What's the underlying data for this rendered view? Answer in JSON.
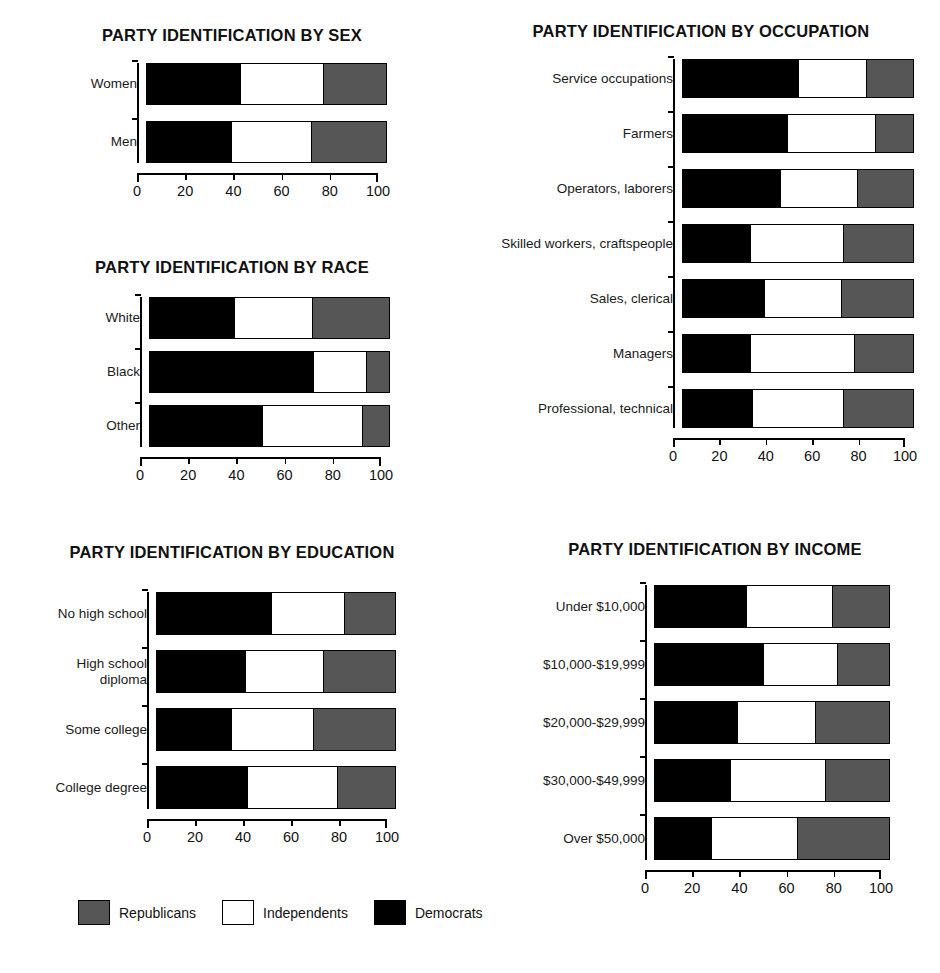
{
  "legend": {
    "items": [
      {
        "key": "rep",
        "label": "Republicans",
        "color": "#565656"
      },
      {
        "key": "ind",
        "label": "Independents",
        "color": "#ffffff"
      },
      {
        "key": "dem",
        "label": "Democrats",
        "color": "#000000"
      }
    ]
  },
  "axis": {
    "ticks": [
      0,
      20,
      40,
      60,
      80,
      100
    ],
    "tick_labels": [
      "0",
      "20",
      "40",
      "60",
      "80",
      "100"
    ],
    "min": 0,
    "max": 100
  },
  "panels": {
    "sex": {
      "title": "PARTY IDENTIFICATION BY SEX"
    },
    "race": {
      "title": "PARTY IDENTIFICATION BY RACE"
    },
    "occupation": {
      "title": "PARTY IDENTIFICATION BY OCCUPATION"
    },
    "education": {
      "title": "PARTY IDENTIFICATION BY EDUCATION"
    },
    "income": {
      "title": "PARTY IDENTIFICATION BY INCOME"
    }
  },
  "chart_data": [
    {
      "id": "sex",
      "type": "bar",
      "orientation": "horizontal",
      "stacked": true,
      "title": "PARTY IDENTIFICATION BY SEX",
      "xlabel": "",
      "ylabel": "",
      "xlim": [
        0,
        100
      ],
      "xticks": [
        0,
        20,
        40,
        60,
        80,
        100
      ],
      "grid": false,
      "legend_position": "bottom",
      "categories": [
        "Women",
        "Men"
      ],
      "series": [
        {
          "name": "Democrats",
          "color": "#000000",
          "values": [
            39,
            35
          ]
        },
        {
          "name": "Independents",
          "color": "#ffffff",
          "values": [
            35,
            34
          ]
        },
        {
          "name": "Republicans",
          "color": "#565656",
          "values": [
            26,
            31
          ]
        }
      ]
    },
    {
      "id": "race",
      "type": "bar",
      "orientation": "horizontal",
      "stacked": true,
      "title": "PARTY IDENTIFICATION BY RACE",
      "xlabel": "",
      "ylabel": "",
      "xlim": [
        0,
        100
      ],
      "xticks": [
        0,
        20,
        40,
        60,
        80,
        100
      ],
      "grid": false,
      "legend_position": "bottom",
      "categories": [
        "White",
        "Black",
        "Other"
      ],
      "series": [
        {
          "name": "Democrats",
          "color": "#000000",
          "values": [
            35,
            68,
            47
          ]
        },
        {
          "name": "Independents",
          "color": "#ffffff",
          "values": [
            33,
            23,
            42
          ]
        },
        {
          "name": "Republicans",
          "color": "#565656",
          "values": [
            32,
            9,
            11
          ]
        }
      ]
    },
    {
      "id": "occupation",
      "type": "bar",
      "orientation": "horizontal",
      "stacked": true,
      "title": "PARTY IDENTIFICATION BY OCCUPATION",
      "xlabel": "",
      "ylabel": "",
      "xlim": [
        0,
        100
      ],
      "xticks": [
        0,
        20,
        40,
        60,
        80,
        100
      ],
      "grid": false,
      "legend_position": "bottom",
      "categories": [
        "Service occupations",
        "Farmers",
        "Operators, laborers",
        "Skilled workers, craftspeople",
        "Sales, clerical",
        "Managers",
        "Professional, technical"
      ],
      "series": [
        {
          "name": "Democrats",
          "color": "#000000",
          "values": [
            50,
            45,
            42,
            29,
            35,
            29,
            30
          ]
        },
        {
          "name": "Independents",
          "color": "#ffffff",
          "values": [
            30,
            39,
            34,
            41,
            34,
            46,
            40
          ]
        },
        {
          "name": "Republicans",
          "color": "#565656",
          "values": [
            20,
            16,
            24,
            30,
            31,
            25,
            30
          ]
        }
      ]
    },
    {
      "id": "education",
      "type": "bar",
      "orientation": "horizontal",
      "stacked": true,
      "title": "PARTY IDENTIFICATION BY EDUCATION",
      "xlabel": "",
      "ylabel": "",
      "xlim": [
        0,
        100
      ],
      "xticks": [
        0,
        20,
        40,
        60,
        80,
        100
      ],
      "grid": false,
      "legend_position": "bottom",
      "categories": [
        "No high school",
        "High school\ndiploma",
        "Some college",
        "College degree"
      ],
      "series": [
        {
          "name": "Democrats",
          "color": "#000000",
          "values": [
            48,
            37,
            31,
            38
          ]
        },
        {
          "name": "Independents",
          "color": "#ffffff",
          "values": [
            31,
            33,
            35,
            38
          ]
        },
        {
          "name": "Republicans",
          "color": "#565656",
          "values": [
            21,
            30,
            34,
            24
          ]
        }
      ]
    },
    {
      "id": "income",
      "type": "bar",
      "orientation": "horizontal",
      "stacked": true,
      "title": "PARTY IDENTIFICATION BY INCOME",
      "xlabel": "",
      "ylabel": "",
      "xlim": [
        0,
        100
      ],
      "xticks": [
        0,
        20,
        40,
        60,
        80,
        100
      ],
      "grid": false,
      "legend_position": "bottom",
      "categories": [
        "Under $10,000",
        "$10,000-$19,999",
        "$20,000-$29,999",
        "$30,000-$49,999",
        "Over $50,000"
      ],
      "series": [
        {
          "name": "Democrats",
          "color": "#000000",
          "values": [
            39,
            46,
            35,
            32,
            24
          ]
        },
        {
          "name": "Independents",
          "color": "#ffffff",
          "values": [
            37,
            32,
            34,
            41,
            37
          ]
        },
        {
          "name": "Republicans",
          "color": "#565656",
          "values": [
            24,
            22,
            31,
            27,
            39
          ]
        }
      ]
    }
  ]
}
